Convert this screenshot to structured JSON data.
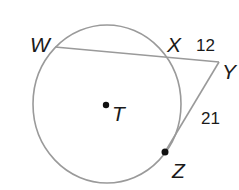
{
  "diagram": {
    "points": {
      "W": {
        "label": "W"
      },
      "X": {
        "label": "X"
      },
      "Y": {
        "label": "Y"
      },
      "Z": {
        "label": "Z"
      },
      "T": {
        "label": "T"
      }
    },
    "segments": {
      "XY": {
        "length_label": "12"
      },
      "YZ": {
        "length_label": "21"
      }
    },
    "colors": {
      "stroke": "#9a9a9a",
      "text": "#1a1a1a",
      "dot": "#111111"
    }
  }
}
